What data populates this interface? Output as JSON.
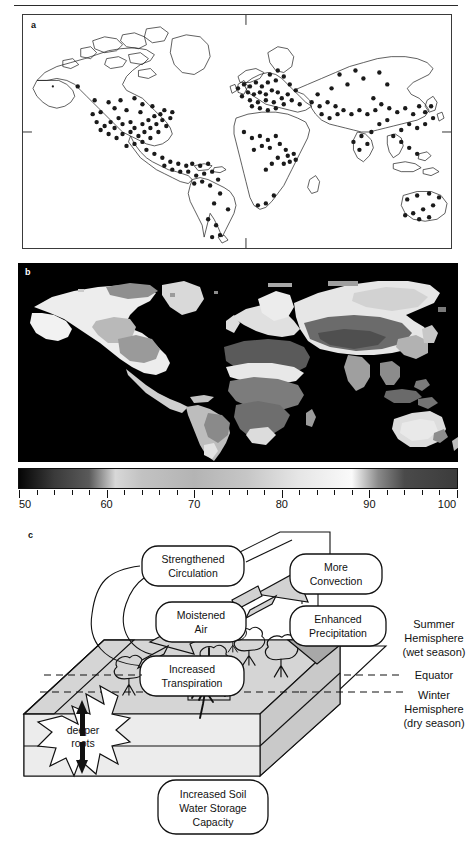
{
  "figure": {
    "panels": [
      {
        "id": "a",
        "letter": "a",
        "type": "world-map-sites"
      },
      {
        "id": "b",
        "letter": "b",
        "type": "world-map-raster"
      },
      {
        "id": "c",
        "letter": "c",
        "type": "concept-diagram"
      }
    ]
  },
  "panel_a": {
    "letter": "a",
    "description": "World map outline with point markers"
  },
  "panel_b": {
    "letter": "b",
    "description": "Global grayscale raster map over black ocean"
  },
  "colorbar": {
    "min": 50,
    "max": 100,
    "major_ticks": [
      50,
      60,
      70,
      80,
      90,
      100
    ],
    "labels": [
      "50",
      "60",
      "70",
      "80",
      "90",
      "100"
    ],
    "minor_tick_step": 2,
    "gradient_stops": [
      {
        "value": 50,
        "color": "#050505"
      },
      {
        "value": 54,
        "color": "#3a3a3a"
      },
      {
        "value": 58,
        "color": "#5a5a5a"
      },
      {
        "value": 61,
        "color": "#d8d8d8"
      },
      {
        "value": 64,
        "color": "#c2c2c2"
      },
      {
        "value": 70,
        "color": "#b4b4b4"
      },
      {
        "value": 76,
        "color": "#c6c6c6"
      },
      {
        "value": 82,
        "color": "#e6e6e6"
      },
      {
        "value": 88,
        "color": "#fafafa"
      },
      {
        "value": 91,
        "color": "#8a8a8a"
      },
      {
        "value": 94,
        "color": "#4a4a4a"
      },
      {
        "value": 100,
        "color": "#3c3c3c"
      }
    ]
  },
  "panel_c": {
    "letter": "c",
    "nodes": [
      {
        "id": "strengthened-circulation",
        "lines": [
          "Strengthened",
          "Circulation"
        ]
      },
      {
        "id": "more-convection",
        "lines": [
          "More",
          "Convection"
        ]
      },
      {
        "id": "moistened-air",
        "lines": [
          "Moistened",
          "Air"
        ]
      },
      {
        "id": "enhanced-precipitation",
        "lines": [
          "Enhanced",
          "Precipitation"
        ]
      },
      {
        "id": "increased-transpiration",
        "lines": [
          "Increased",
          "Transpiration"
        ]
      },
      {
        "id": "increased-soil-water",
        "lines": [
          "Increased Soil",
          "Water Storage",
          "Capacity"
        ]
      },
      {
        "id": "deeper-roots",
        "lines": [
          "deeper",
          "roots"
        ]
      }
    ],
    "side_labels": [
      {
        "id": "summer-hemisphere",
        "lines": [
          "Summer",
          "Hemisphere",
          "(wet season)"
        ]
      },
      {
        "id": "equator",
        "lines": [
          "Equator"
        ]
      },
      {
        "id": "winter-hemisphere",
        "lines": [
          "Winter",
          "Hemisphere",
          "(dry season)"
        ]
      }
    ],
    "text": {
      "strengthened_circulation_1": "Strengthened",
      "strengthened_circulation_2": "Circulation",
      "more_convection_1": "More",
      "more_convection_2": "Convection",
      "moistened_air_1": "Moistened",
      "moistened_air_2": "Air",
      "enhanced_precipitation_1": "Enhanced",
      "enhanced_precipitation_2": "Precipitation",
      "increased_transpiration_1": "Increased",
      "increased_transpiration_2": "Transpiration",
      "soil_1": "Increased Soil",
      "soil_2": "Water Storage",
      "soil_3": "Capacity",
      "deeper_roots_1": "deeper",
      "deeper_roots_2": "roots",
      "summer_1": "Summer",
      "summer_2": "Hemisphere",
      "summer_3": "(wet season)",
      "equator": "Equator",
      "winter_1": "Winter",
      "winter_2": "Hemisphere",
      "winter_3": "(dry season)"
    }
  },
  "chart_data": {
    "type": "heatmap",
    "title": "",
    "xlabel": "",
    "ylabel": "",
    "colorbar": {
      "label": "",
      "range": [
        50,
        100
      ],
      "ticks": [
        50,
        60,
        70,
        80,
        90,
        100
      ],
      "tick_labels": [
        "50",
        "60",
        "70",
        "80",
        "90",
        "100"
      ]
    },
    "panels": [
      {
        "letter": "a",
        "type": "scatter",
        "projection": "equirectangular",
        "xlim": [
          -180,
          180
        ],
        "ylim": [
          -90,
          90
        ],
        "grid": false,
        "marker": "filled-circle",
        "points": [
          [
            -155,
            60
          ],
          [
            -149,
            64
          ],
          [
            -135,
            58
          ],
          [
            -120,
            50
          ],
          [
            -122,
            45
          ],
          [
            -118,
            40
          ],
          [
            -112,
            45
          ],
          [
            -108,
            39
          ],
          [
            -105,
            40
          ],
          [
            -102,
            47
          ],
          [
            -100,
            42
          ],
          [
            -98,
            36
          ],
          [
            -96,
            44
          ],
          [
            -95,
            30
          ],
          [
            -93,
            38
          ],
          [
            -92,
            34
          ],
          [
            -90,
            45
          ],
          [
            -88,
            41
          ],
          [
            -86,
            36
          ],
          [
            -84,
            33
          ],
          [
            -83,
            42
          ],
          [
            -81,
            29
          ],
          [
            -80,
            40
          ],
          [
            -78,
            37
          ],
          [
            -77,
            44
          ],
          [
            -76,
            35
          ],
          [
            -75,
            40
          ],
          [
            -73,
            42
          ],
          [
            -72,
            45
          ],
          [
            -71,
            43
          ],
          [
            -70,
            46
          ],
          [
            -68,
            47
          ],
          [
            -110,
            32
          ],
          [
            -115,
            36
          ],
          [
            -106,
            33
          ],
          [
            -103,
            31
          ],
          [
            -99,
            20
          ],
          [
            -97,
            25
          ],
          [
            -95,
            17
          ],
          [
            -92,
            15
          ],
          [
            -90,
            19
          ],
          [
            -88,
            21
          ],
          [
            -86,
            12
          ],
          [
            -84,
            10
          ],
          [
            -82,
            23
          ],
          [
            -80,
            25
          ],
          [
            -78,
            18
          ],
          [
            -76,
            8
          ],
          [
            -74,
            5
          ],
          [
            -72,
            20
          ],
          [
            -70,
            12
          ],
          [
            -68,
            10
          ],
          [
            -66,
            18
          ],
          [
            -64,
            16
          ],
          [
            -62,
            9
          ],
          [
            -60,
            4
          ],
          [
            -58,
            -2
          ],
          [
            -55,
            -8
          ],
          [
            -52,
            -12
          ],
          [
            -48,
            -16
          ],
          [
            -60,
            -20
          ],
          [
            -64,
            -28
          ],
          [
            -68,
            -34
          ],
          [
            -70,
            -40
          ],
          [
            -71,
            -45
          ],
          [
            -72,
            -50
          ],
          [
            -73,
            -53
          ],
          [
            -58,
            -34
          ],
          [
            -55,
            -25
          ],
          [
            -10,
            37
          ],
          [
            -8,
            40
          ],
          [
            -6,
            43
          ],
          [
            -4,
            50
          ],
          [
            -2,
            48
          ],
          [
            0,
            45
          ],
          [
            2,
            52
          ],
          [
            4,
            47
          ],
          [
            5,
            55
          ],
          [
            6,
            50
          ],
          [
            7,
            58
          ],
          [
            8,
            46
          ],
          [
            9,
            53
          ],
          [
            10,
            60
          ],
          [
            11,
            48
          ],
          [
            12,
            56
          ],
          [
            13,
            51
          ],
          [
            14,
            63
          ],
          [
            15,
            46
          ],
          [
            16,
            59
          ],
          [
            17,
            54
          ],
          [
            18,
            49
          ],
          [
            19,
            61
          ],
          [
            20,
            44
          ],
          [
            21,
            57
          ],
          [
            22,
            50
          ],
          [
            23,
            65
          ],
          [
            24,
            46
          ],
          [
            25,
            55
          ],
          [
            26,
            60
          ],
          [
            27,
            42
          ],
          [
            28,
            52
          ],
          [
            30,
            58
          ],
          [
            32,
            47
          ],
          [
            34,
            44
          ],
          [
            36,
            56
          ],
          [
            38,
            50
          ],
          [
            40,
            42
          ],
          [
            42,
            54
          ],
          [
            45,
            48
          ],
          [
            48,
            40
          ],
          [
            50,
            52
          ],
          [
            55,
            45
          ],
          [
            60,
            56
          ],
          [
            65,
            50
          ],
          [
            70,
            60
          ],
          [
            75,
            55
          ],
          [
            80,
            62
          ],
          [
            85,
            48
          ],
          [
            90,
            53
          ],
          [
            95,
            58
          ],
          [
            100,
            44
          ],
          [
            105,
            50
          ],
          [
            110,
            56
          ],
          [
            115,
            40
          ],
          [
            120,
            46
          ],
          [
            125,
            52
          ],
          [
            128,
            36
          ],
          [
            132,
            34
          ],
          [
            135,
            38
          ],
          [
            138,
            42
          ],
          [
            140,
            36
          ],
          [
            120,
            30
          ],
          [
            115,
            28
          ],
          [
            110,
            25
          ],
          [
            105,
            20
          ],
          [
            100,
            15
          ],
          [
            98,
            10
          ],
          [
            102,
            5
          ],
          [
            110,
            3
          ],
          [
            115,
            0
          ],
          [
            120,
            -5
          ],
          [
            125,
            -8
          ],
          [
            130,
            -3
          ],
          [
            -5,
            10
          ],
          [
            0,
            8
          ],
          [
            5,
            12
          ],
          [
            10,
            6
          ],
          [
            15,
            9
          ],
          [
            18,
            4
          ],
          [
            20,
            0
          ],
          [
            22,
            -5
          ],
          [
            25,
            -12
          ],
          [
            28,
            -18
          ],
          [
            30,
            -24
          ],
          [
            25,
            -28
          ],
          [
            20,
            -30
          ],
          [
            18,
            -22
          ],
          [
            15,
            -15
          ],
          [
            12,
            -8
          ],
          [
            8,
            -2
          ],
          [
            30,
            0
          ],
          [
            35,
            5
          ],
          [
            38,
            10
          ],
          [
            145,
            -20
          ],
          [
            148,
            -25
          ],
          [
            150,
            -30
          ],
          [
            145,
            -35
          ],
          [
            140,
            -32
          ],
          [
            135,
            -33
          ],
          [
            152,
            -28
          ],
          [
            147,
            -38
          ],
          [
            175,
            -40
          ],
          [
            172,
            -43
          ]
        ]
      },
      {
        "letter": "b",
        "type": "heatmap",
        "projection": "equirectangular",
        "xlim": [
          -180,
          180
        ],
        "ylim": [
          -90,
          90
        ],
        "background": "#000000",
        "value_range": [
          50,
          100
        ],
        "description": "Global gridded field rendered in grayscale, ocean masked black"
      }
    ]
  }
}
